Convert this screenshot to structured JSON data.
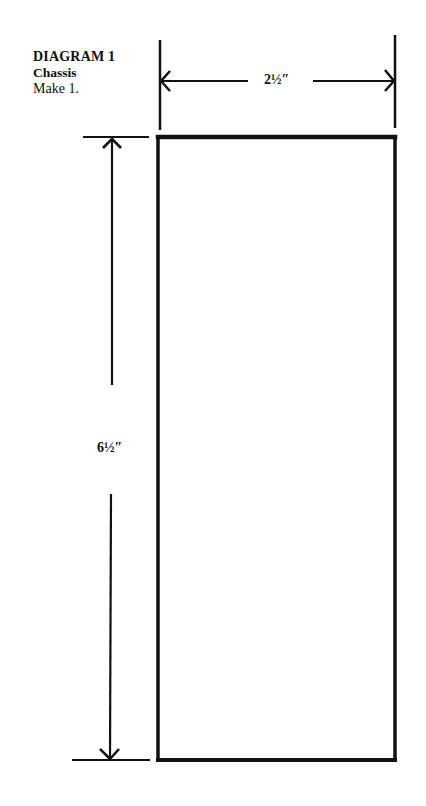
{
  "caption": {
    "title": "DIAGRAM 1",
    "part_name": "Chassis",
    "quantity": "Make 1."
  },
  "dimensions": {
    "width_label": "2½″",
    "height_label": "6½″"
  },
  "colors": {
    "line": "#111111",
    "background": "#ffffff"
  }
}
